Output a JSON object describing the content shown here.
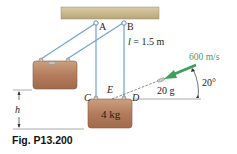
{
  "figure": {
    "caption": "Fig. P13.200",
    "labels": {
      "A": "A",
      "B": "B",
      "C": "C",
      "D": "D",
      "E": "E",
      "h": "h",
      "length": "l = 1.5 m",
      "length_var": "l",
      "length_val": "= 1.5 m",
      "velocity": "600 m/s",
      "bullet_mass": "20 g",
      "angle": "20°",
      "block_mass": "4 kg"
    },
    "colors": {
      "ceiling": "#c9b98f",
      "cord": "#6fa3d8",
      "block": "#b98363",
      "arrow": "#3aa05a",
      "velocity_text": "#4a9a6a",
      "line": "#888888"
    }
  }
}
